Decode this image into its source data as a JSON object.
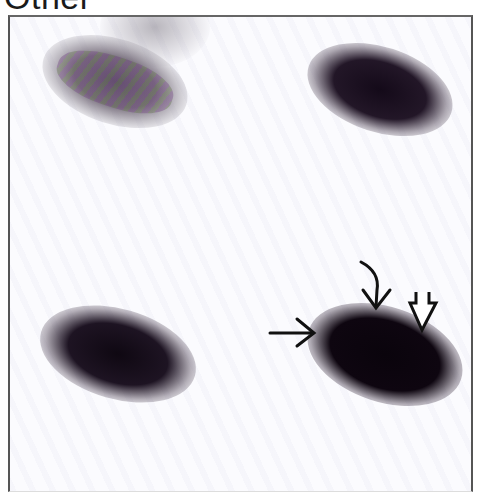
{
  "figure": {
    "title_label": "Other",
    "panels": [
      {
        "position": "top-left",
        "intensity": "faint",
        "color": "#6a6070"
      },
      {
        "position": "top-right",
        "intensity": "dark",
        "color": "#1a0f1c"
      },
      {
        "position": "bottom-left",
        "intensity": "dark",
        "color": "#140a16"
      },
      {
        "position": "bottom-right",
        "intensity": "darkest",
        "color": "#0d050f"
      }
    ],
    "annotations": [
      {
        "type": "straight-arrow",
        "direction": "right"
      },
      {
        "type": "curved-arrow",
        "direction": "down"
      },
      {
        "type": "open-arrow",
        "direction": "down"
      }
    ]
  }
}
